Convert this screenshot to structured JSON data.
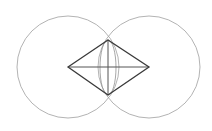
{
  "diagram": {
    "colors": {
      "circle": "#a0a0a0",
      "rhombus": "#3a3a3a",
      "lens": "#909090",
      "axis": "#555555"
    },
    "circles": [
      {
        "cx": 68,
        "cy": 67,
        "r": 51
      },
      {
        "cx": 149,
        "cy": 67,
        "r": 51
      }
    ],
    "rhombus_points": "68,67 108,40 149,67 108,95",
    "lens": {
      "cx": 108,
      "cy": 67.5,
      "rx": 8,
      "ry": 27.5
    },
    "horizontal_line": {
      "x1": 68,
      "y1": 67,
      "x2": 149,
      "y2": 67
    },
    "vertical_line": {
      "x1": 108,
      "y1": 40,
      "x2": 108,
      "y2": 95
    }
  }
}
